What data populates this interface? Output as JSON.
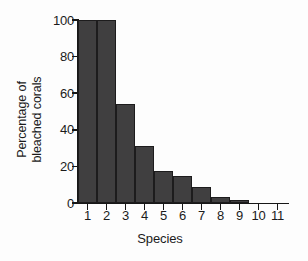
{
  "chart_data": {
    "type": "bar",
    "title": "",
    "xlabel": "Species",
    "ylabel_lines": [
      "Percentage of",
      "bleached corals"
    ],
    "ylabel": "Percentage of bleached corals",
    "categories": [
      "1",
      "2",
      "3",
      "4",
      "5",
      "6",
      "7",
      "8",
      "9",
      "10",
      "11"
    ],
    "values": [
      100,
      100,
      54,
      31,
      17.5,
      14.5,
      8.5,
      3.5,
      1.8,
      0,
      0
    ],
    "ylim": [
      0,
      100
    ],
    "yticks": [
      0,
      20,
      40,
      60,
      80,
      100
    ],
    "ytick_labels": [
      "0",
      "20",
      "40",
      "60",
      "80",
      "100"
    ],
    "xlim_categories": 11,
    "grid": false,
    "legend": false,
    "bar_color": "#403f40",
    "bar_edge_color": "#1d1c1d",
    "axis_color": "#171717",
    "background_color": "#fdfdfd"
  }
}
